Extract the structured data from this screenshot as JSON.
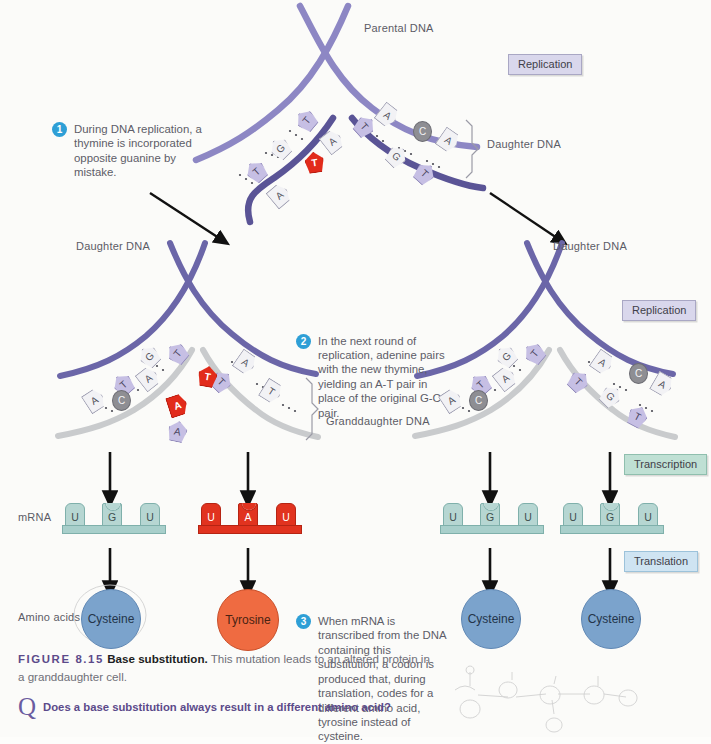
{
  "figure": {
    "number": "FIGURE 8.15",
    "title": "Base substitution.",
    "caption": "This mutation leads to an altered protein in a granddaughter cell.",
    "question": "Does a base substitution always result in a different amino acid?",
    "question_icon": "question-mark-icon"
  },
  "colors": {
    "accent_step": "#2e9fd6",
    "mutation_red": "#e22b1b",
    "parental_strand": "#8d87c4",
    "daughter_strand": "#5a5496",
    "new_strand": "#c9cbcd",
    "cysteine": "#7ba3cc",
    "tyrosine": "#ef6b41",
    "replication_box": "#d9d7ec",
    "transcription_box": "#bfe0d4",
    "translation_box": "#cfe4f2",
    "figure_number": "#5b4a8a"
  },
  "steps": [
    {
      "num": "1",
      "text": "During DNA replication, a thymine is incorporated opposite guanine by mistake."
    },
    {
      "num": "2",
      "text": "In the next round of replication, adenine pairs with the new thymine, yielding an A-T pair in place of the original G-C pair."
    },
    {
      "num": "3",
      "text": "When mRNA is transcribed from the DNA containing this substitution, a codon is produced that, during translation, codes for a different amino acid, tyrosine instead of cysteine."
    }
  ],
  "process_boxes": [
    {
      "label": "Replication",
      "type": "repl"
    },
    {
      "label": "Replication",
      "type": "repl"
    },
    {
      "label": "Transcription",
      "type": "tran"
    },
    {
      "label": "Translation",
      "type": "trl"
    }
  ],
  "labels": {
    "parental_dna": "Parental DNA",
    "daughter_dna": "Daughter DNA",
    "granddaughter_dna": "Granddaughter DNA",
    "mrna": "mRNA",
    "amino_acids": "Amino acids"
  },
  "top_fork": {
    "left_branch_bases": [
      "T",
      "A",
      "G",
      "T",
      "T",
      "A"
    ],
    "right_branch_bases": [
      "A",
      "T",
      "C",
      "G",
      "A",
      "T"
    ],
    "mutant_base": "T"
  },
  "mid_left_fork": {
    "left_branch_bases": [
      "T",
      "A",
      "G",
      "C",
      "T",
      "A"
    ],
    "right_branch_bases": [
      "A",
      "T",
      "T",
      "A",
      "A",
      "T"
    ],
    "mutant_bases": [
      "T",
      "A"
    ]
  },
  "mid_right_fork": {
    "left_branch_bases": [
      "T",
      "A",
      "G",
      "C",
      "T",
      "A"
    ],
    "right_branch_bases": [
      "A",
      "T",
      "C",
      "G",
      "A",
      "T"
    ]
  },
  "mrna_strands": [
    {
      "id": "mrna-1",
      "codon": [
        "U",
        "G",
        "U"
      ],
      "color": "teal",
      "amino_acid": "Cysteine"
    },
    {
      "id": "mrna-2",
      "codon": [
        "U",
        "A",
        "U"
      ],
      "color": "red",
      "amino_acid": "Tyrosine"
    },
    {
      "id": "mrna-3",
      "codon": [
        "U",
        "G",
        "U"
      ],
      "color": "teal",
      "amino_acid": "Cysteine"
    },
    {
      "id": "mrna-4",
      "codon": [
        "U",
        "G",
        "U"
      ],
      "color": "teal",
      "amino_acid": "Cysteine"
    }
  ],
  "amino_acids": [
    {
      "name": "Cysteine",
      "kind": "cys"
    },
    {
      "name": "Tyrosine",
      "kind": "tyr"
    },
    {
      "name": "Cysteine",
      "kind": "cys"
    },
    {
      "name": "Cysteine",
      "kind": "cys"
    }
  ]
}
